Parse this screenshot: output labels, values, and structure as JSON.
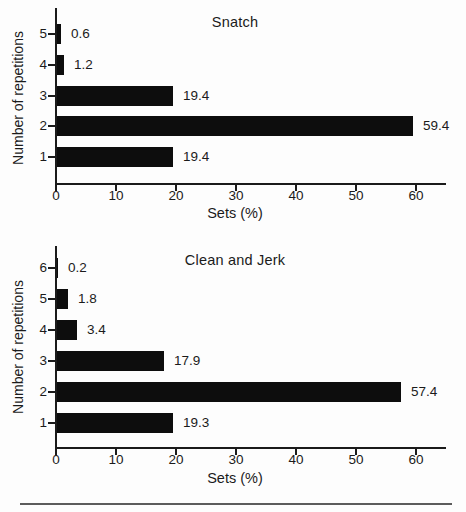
{
  "page": {
    "background": "#fdfdfd",
    "text_color": "#1b1b1b",
    "axis_color": "#1b1b1b",
    "divider_color": "#5c5c5c"
  },
  "chart_data": [
    {
      "type": "bar",
      "orientation": "horizontal",
      "title": "Snatch",
      "xlabel": "Sets (%)",
      "ylabel": "Number of repetitions",
      "categories": [
        "5",
        "4",
        "3",
        "2",
        "1"
      ],
      "values": [
        0.6,
        1.2,
        19.4,
        59.4,
        19.4
      ],
      "value_labels": [
        "0.6",
        "1.2",
        "19.4",
        "59.4",
        "19.4"
      ],
      "x_ticks": [
        "0",
        "10",
        "20",
        "30",
        "40",
        "50",
        "60"
      ],
      "x_tick_values": [
        0,
        10,
        20,
        30,
        40,
        50,
        60
      ],
      "xlim": [
        0,
        65
      ],
      "bar_color": "#0d0d0d",
      "grid": false,
      "legend": false
    },
    {
      "type": "bar",
      "orientation": "horizontal",
      "title": "Clean and Jerk",
      "xlabel": "Sets (%)",
      "ylabel": "Number of repetitions",
      "categories": [
        "6",
        "5",
        "4",
        "3",
        "2",
        "1"
      ],
      "values": [
        0.2,
        1.8,
        3.4,
        17.9,
        57.4,
        19.3
      ],
      "value_labels": [
        "0.2",
        "1.8",
        "3.4",
        "17.9",
        "57.4",
        "19.3"
      ],
      "x_ticks": [
        "0",
        "10",
        "20",
        "30",
        "40",
        "50",
        "60"
      ],
      "x_tick_values": [
        0,
        10,
        20,
        30,
        40,
        50,
        60
      ],
      "xlim": [
        0,
        65
      ],
      "bar_color": "#0d0d0d",
      "grid": false,
      "legend": false
    }
  ]
}
